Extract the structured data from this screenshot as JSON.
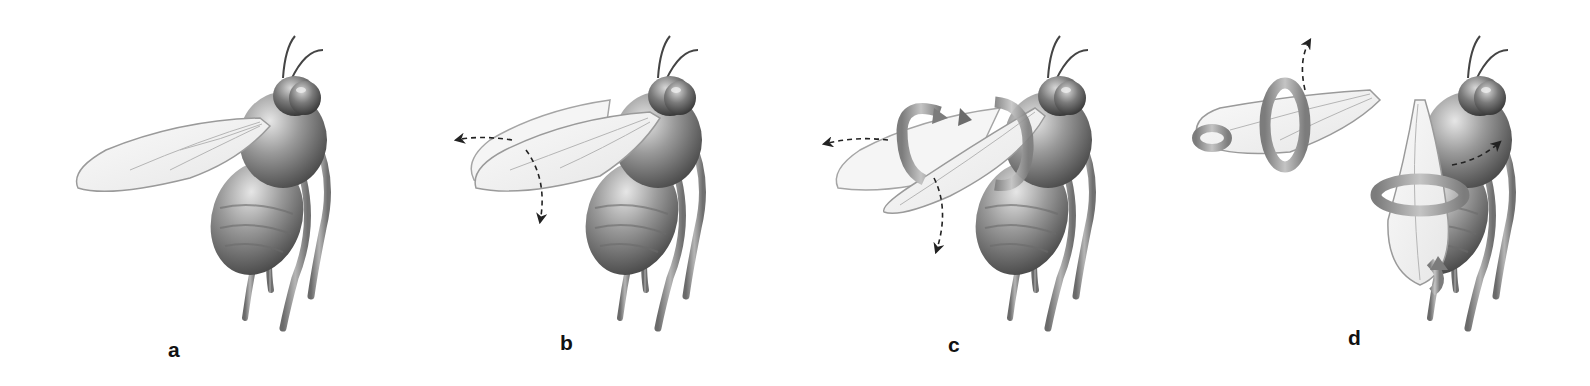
{
  "figure": {
    "panels": [
      {
        "id": "a",
        "label": "a",
        "state": "wings folded at rest, no motion arrows"
      },
      {
        "id": "b",
        "label": "b",
        "state": "wing begins to extend; dashed arrows: outward (left) and downward"
      },
      {
        "id": "c",
        "label": "c",
        "state": "wings separating with rotation; circular rotation arrows and dashed arrows left and down"
      },
      {
        "id": "d",
        "label": "d",
        "state": "wings fully extended; rotation arrows around both wings and dashed arrows up and right"
      }
    ]
  },
  "colors": {
    "background": "#ffffff",
    "body": "#8a8a8a",
    "body_dark": "#555555",
    "wing_fill": "#f2f2f2",
    "wing_edge": "#9a9a9a",
    "rotation_arrow": "#a0a0a0",
    "dashed_arrow": "#222222",
    "label": "#111111"
  }
}
